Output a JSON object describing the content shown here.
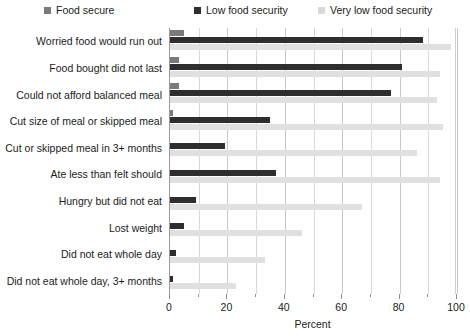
{
  "chart_data": {
    "type": "bar",
    "orientation": "horizontal",
    "title": "",
    "xlabel": "Percent",
    "ylabel": "",
    "xlim": [
      0,
      100
    ],
    "ylim": null,
    "grid": true,
    "legend_position": "top",
    "x_ticks": [
      0,
      20,
      40,
      60,
      80,
      100
    ],
    "x_tick_labels": [
      "0",
      "20",
      "40",
      "60",
      "80",
      "100"
    ],
    "x_minor_ticks": [
      10,
      30,
      50,
      70,
      90
    ],
    "categories": [
      "Worried food would run out",
      "Food bought did not last",
      "Could not afford balanced meal",
      "Cut size of meal or skipped meal",
      "Cut or skipped meal in 3+ months",
      "Ate less than felt should",
      "Hungry but did not eat",
      "Lost weight",
      "Did not eat whole day",
      "Did not eat whole day, 3+ months"
    ],
    "series": [
      {
        "name": "Food secure",
        "color": "#7a7a7a",
        "values": [
          5,
          3,
          3,
          1,
          0,
          0,
          0,
          0,
          0,
          0
        ]
      },
      {
        "name": "Low food security",
        "color": "#2e2e2e",
        "values": [
          88,
          81,
          77,
          35,
          19,
          37,
          9,
          5,
          2,
          1
        ]
      },
      {
        "name": "Very low food security",
        "color": "#e0e0e0",
        "values": [
          98,
          94,
          93,
          95,
          86,
          94,
          67,
          46,
          33,
          23
        ]
      }
    ]
  },
  "legend": {
    "items": [
      {
        "label": "Food secure",
        "color": "#7a7a7a"
      },
      {
        "label": "Low food security",
        "color": "#2e2e2e"
      },
      {
        "label": "Very low food security",
        "color": "#d9d9d9"
      }
    ]
  },
  "axis": {
    "x_title": "Percent"
  }
}
